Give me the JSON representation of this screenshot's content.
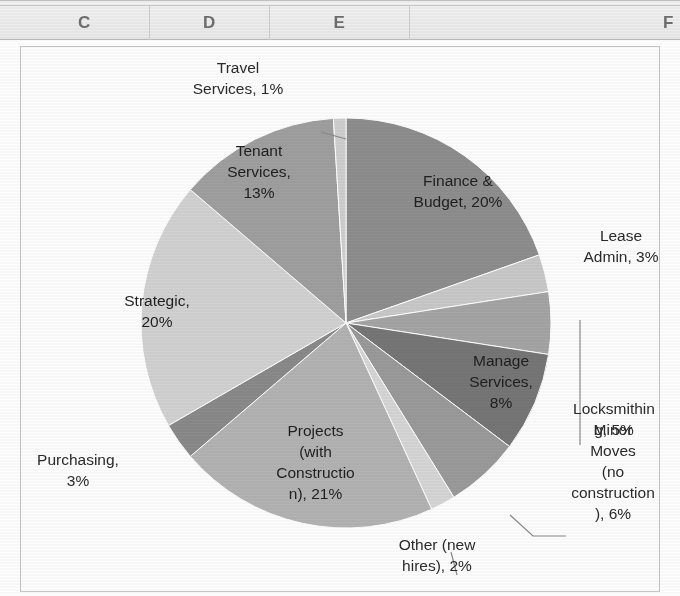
{
  "spreadsheet": {
    "columns": [
      {
        "label": "C",
        "x": 20,
        "w": 130
      },
      {
        "label": "D",
        "x": 150,
        "w": 120
      },
      {
        "label": "E",
        "x": 270,
        "w": 140
      },
      {
        "label": "F",
        "x": 570,
        "w": 110
      }
    ]
  },
  "chart_data": {
    "type": "pie",
    "title": "",
    "start_angle_deg": 0,
    "direction": "clockwise",
    "labels_show_percent": true,
    "legend": "none",
    "grid": false,
    "categories": [
      "Finance & Budget",
      "Lease Admin",
      "Locksmithing",
      "Manage Services",
      "Minor Moves (no construction)",
      "Other (new hires)",
      "Projects (with Construction)",
      "Purchasing",
      "Strategic",
      "Tenant Services",
      "Travel Services"
    ],
    "values": [
      20,
      3,
      5,
      8,
      6,
      2,
      21,
      3,
      20,
      13,
      1
    ],
    "unit": "%",
    "total": 102,
    "colors": [
      "#8e8e8e",
      "#c9c9c9",
      "#a5a5a5",
      "#767676",
      "#9a9a9a",
      "#d6d6d6",
      "#b3b3b3",
      "#8a8a8a",
      "#d2d2d2",
      "#9f9f9f",
      "#cfcfcf"
    ],
    "slice_labels": [
      "Finance &\nBudget, 20%",
      "Lease\nAdmin, 3%",
      "Locksmithin\ng, 5%",
      "Manage\nServices,\n8%",
      "Minor\nMoves\n(no\nconstruction\n), 6%",
      "Other (new\nhires), 2%",
      "Projects\n(with\nConstructio\nn), 21%",
      "Purchasing,\n3%",
      "Strategic,\n20%",
      "Tenant\nServices,\n13%",
      "Travel\nServices, 1%"
    ]
  },
  "labels": {
    "travel_services": "Travel\nServices, 1%",
    "tenant_services": "Tenant\nServices,\n13%",
    "finance_budget": "Finance &\nBudget, 20%",
    "lease_admin": "Lease\nAdmin, 3%",
    "manage_services": "Manage\nServices,\n8%",
    "locksmithing": "Locksmithin\ng, 5%",
    "minor_moves": "Minor\nMoves\n(no\nconstruction\n), 6%",
    "other_new_hires": "Other (new\nhires), 2%",
    "projects": "Projects\n(with\nConstructio\nn), 21%",
    "purchasing": "Purchasing,\n3%",
    "strategic": "Strategic,\n20%"
  }
}
